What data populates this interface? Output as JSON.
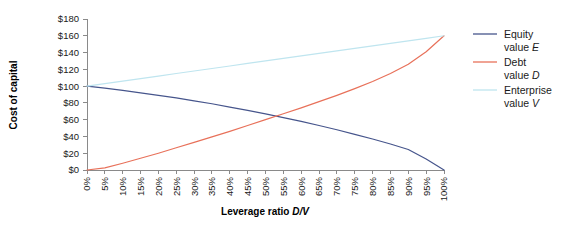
{
  "chart_data": {
    "type": "line",
    "title": "",
    "xlabel": "Leverage ratio D/V",
    "xlabel_plain": "Leverage ratio ",
    "xlabel_italic": "D/V",
    "ylabel": "Cost of capital",
    "xlim": [
      0,
      100
    ],
    "ylim": [
      0,
      180
    ],
    "grid": false,
    "legend_position": "right",
    "x_tick_labels": [
      "0%",
      "5%",
      "10%",
      "15%",
      "20%",
      "25%",
      "30%",
      "35%",
      "40%",
      "45%",
      "50%",
      "55%",
      "60%",
      "65%",
      "70%",
      "75%",
      "80%",
      "85%",
      "90%",
      "95%",
      "100%"
    ],
    "y_tick_labels": [
      "$0",
      "$20",
      "$40",
      "$60",
      "$80",
      "$100",
      "$120",
      "$140",
      "$160",
      "$180"
    ],
    "y_tick_values": [
      0,
      20,
      40,
      60,
      80,
      100,
      120,
      140,
      160,
      180
    ],
    "x": [
      0,
      5,
      10,
      15,
      20,
      25,
      30,
      35,
      40,
      45,
      50,
      55,
      60,
      65,
      70,
      75,
      80,
      85,
      90,
      95,
      100
    ],
    "series": [
      {
        "name": "Equity value E",
        "name_plain": "Equity value ",
        "name_italic": "E",
        "label_line1": "Equity",
        "label_line2_plain": "value ",
        "label_line2_italic": "E",
        "color": "#46558c",
        "values": [
          100,
          97.5,
          95,
          92,
          89,
          86,
          82.5,
          79,
          75,
          71,
          67,
          62.5,
          58,
          53,
          48,
          42.5,
          37,
          31,
          24.5,
          13,
          0
        ]
      },
      {
        "name": "Debt value D",
        "name_plain": "Debt value ",
        "name_italic": "D",
        "label_line1": "Debt",
        "label_line2_plain": "value ",
        "label_line2_italic": "D",
        "color": "#e8715a",
        "values": [
          0,
          2.5,
          8,
          14,
          20,
          26.5,
          33,
          39.5,
          46,
          53,
          60,
          67,
          74,
          81.5,
          89,
          97,
          105.5,
          115,
          126,
          141,
          160
        ]
      },
      {
        "name": "Enterprise value V",
        "name_plain": "Enterprise value ",
        "name_italic": "V",
        "label_line1": "Enterprise",
        "label_line2_plain": "value ",
        "label_line2_italic": "V",
        "color": "#bfe5ef",
        "values": [
          100,
          103,
          106,
          109,
          112,
          115,
          118,
          121,
          124,
          127,
          130,
          133,
          136,
          139,
          142,
          145,
          148,
          151,
          154,
          157,
          160
        ]
      }
    ],
    "annotations": []
  },
  "colors": {
    "equity": "#46558c",
    "debt": "#e8715a",
    "enterprise": "#bfe5ef",
    "axis": "#8a8a8a",
    "text": "#1a1a1a",
    "background": "#ffffff"
  }
}
